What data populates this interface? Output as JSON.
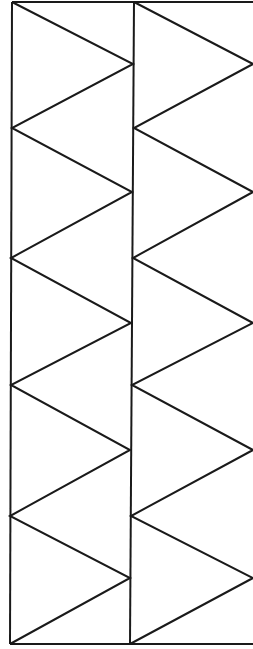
{
  "diagram": {
    "type": "zigzag-triangle-strip",
    "width": 253,
    "height": 649,
    "stroke_color": "#1a1a1a",
    "background": "#ffffff",
    "frame": {
      "top": [
        [
          12,
          2
        ],
        [
          253,
          2
        ]
      ],
      "bottom": [
        [
          10,
          644
        ],
        [
          253,
          644
        ]
      ],
      "left": [
        [
          12,
          2
        ],
        [
          10,
          644
        ]
      ],
      "middle": [
        [
          134,
          2
        ],
        [
          130,
          644
        ]
      ]
    },
    "columns": [
      {
        "name": "left-zigzag",
        "points": [
          [
            12,
            2
          ],
          [
            133,
            64
          ],
          [
            12,
            128
          ],
          [
            132,
            192
          ],
          [
            11,
            258
          ],
          [
            131,
            323
          ],
          [
            11,
            385
          ],
          [
            130,
            450
          ],
          [
            10,
            516
          ],
          [
            130,
            578
          ],
          [
            10,
            644
          ]
        ]
      },
      {
        "name": "right-zigzag",
        "points": [
          [
            134,
            2
          ],
          [
            253,
            64
          ],
          [
            134,
            128
          ],
          [
            253,
            192
          ],
          [
            133,
            258
          ],
          [
            253,
            323
          ],
          [
            132,
            385
          ],
          [
            253,
            450
          ],
          [
            131,
            516
          ],
          [
            253,
            578
          ],
          [
            130,
            644
          ]
        ]
      }
    ]
  }
}
